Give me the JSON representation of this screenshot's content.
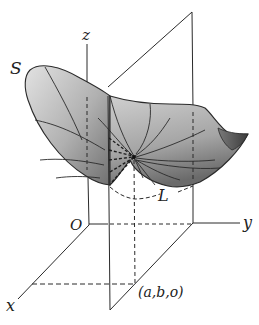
{
  "figure": {
    "type": "3d-surface-diagram",
    "labels": {
      "z_axis": "z",
      "y_axis": "y",
      "x_axis": "x",
      "origin": "O",
      "surface": "S",
      "curve": "L",
      "point": "(a,b,o)"
    },
    "colors": {
      "line": "#2a2a2a",
      "surface_light": "#dcdcdc",
      "surface_mid": "#a8a8a8",
      "surface_dark": "#6e6e6e",
      "background": "#ffffff"
    }
  }
}
